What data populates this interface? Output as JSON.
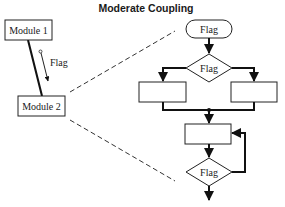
{
  "title": "Moderate Coupling",
  "structure_chart": {
    "module1": {
      "label": "Module 1"
    },
    "module2": {
      "label": "Module 2"
    },
    "coupling": {
      "label": "Flag"
    }
  },
  "flowchart": {
    "terminal": {
      "label": "Flag"
    },
    "decision_top": {
      "label": "Flag"
    },
    "decision_bottom": {
      "label": "Flag"
    },
    "process_left": {
      "label": ""
    },
    "process_right": {
      "label": ""
    },
    "process_middle": {
      "label": ""
    }
  },
  "colors": {
    "stroke": "#111111",
    "background": "#ffffff"
  }
}
